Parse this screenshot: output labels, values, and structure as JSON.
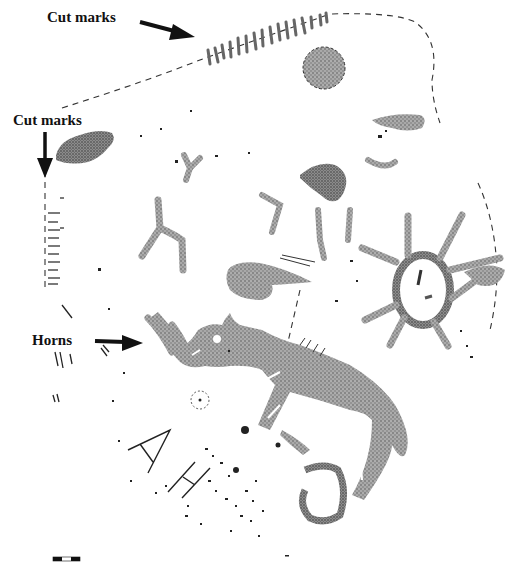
{
  "figure": {
    "type": "rock art tracing",
    "background": "#ffffff",
    "stipple_color": "#8a8a8a",
    "ink_color": "#111111"
  },
  "annotations": [
    {
      "id": "cut-marks-top",
      "text": "Cut marks",
      "arrow_direction": "right-down"
    },
    {
      "id": "cut-marks-left",
      "text": "Cut marks",
      "arrow_direction": "down"
    },
    {
      "id": "horns",
      "text": "Horns",
      "arrow_direction": "right"
    }
  ],
  "engraved_letters": [
    "A",
    "H"
  ],
  "elements": {
    "main_figure": "rhinoceros-like animal with horns",
    "circle_figure": "sun-like circle with radiating lines",
    "small_disc": "stippled disc",
    "dashed_outline": "dashed panel outline"
  },
  "scale_bar": {
    "segments": 3
  }
}
